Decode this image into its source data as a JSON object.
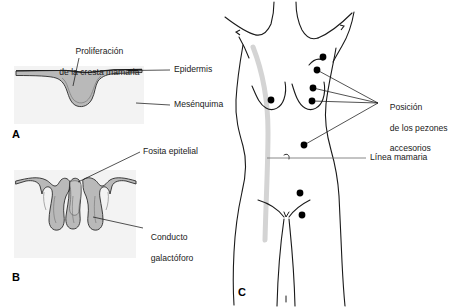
{
  "figure": {
    "background_color": "#ffffff",
    "panel_tint": "#f2f2f2",
    "tissue_fill": "#b8b8b8",
    "line_color": "#1a1a1a",
    "mammary_line_color": "#d0d0d0"
  },
  "panels": [
    {
      "id": "A",
      "letter": "A",
      "name": "panel-a-mammary-ridge",
      "labels": [
        {
          "name": "label-mammary-ridge-proliferation",
          "line1": "Proliferación",
          "line2": "de la cresta mamaria"
        },
        {
          "name": "label-epidermis",
          "text": "Epidermis"
        },
        {
          "name": "label-mesenchyme",
          "text": "Mesénquima"
        }
      ]
    },
    {
      "id": "B",
      "letter": "B",
      "name": "panel-b-lactiferous-ducts",
      "labels": [
        {
          "name": "label-epithelial-pit",
          "text": "Fosita epitelial"
        },
        {
          "name": "label-lactiferous-duct",
          "line1": "Conducto",
          "line2": "galactóforo"
        }
      ],
      "duct_count": 5
    },
    {
      "id": "C",
      "letter": "C",
      "name": "panel-c-female-torso",
      "labels": [
        {
          "name": "label-accessory-nipple-positions",
          "line1": "Posición",
          "line2": "de los pezones",
          "line3": "accesorios"
        },
        {
          "name": "label-mammary-line",
          "text": "Línea mamaria"
        }
      ],
      "accessory_nipple_dots": [
        {
          "name": "dot-axillary",
          "x": 323,
          "y": 57
        },
        {
          "name": "dot-upper-thoracic",
          "x": 317,
          "y": 70
        },
        {
          "name": "dot-medial-breast",
          "x": 313,
          "y": 88
        },
        {
          "name": "dot-nipple-right",
          "x": 312,
          "y": 101
        },
        {
          "name": "dot-nipple-left",
          "x": 271,
          "y": 100
        },
        {
          "name": "dot-abdominal",
          "x": 304,
          "y": 145
        },
        {
          "name": "dot-inguinal-upper",
          "x": 300,
          "y": 193
        },
        {
          "name": "dot-inguinal-lower",
          "x": 302,
          "y": 215
        }
      ],
      "leader_target": {
        "x": 378,
        "y": 103
      }
    }
  ]
}
